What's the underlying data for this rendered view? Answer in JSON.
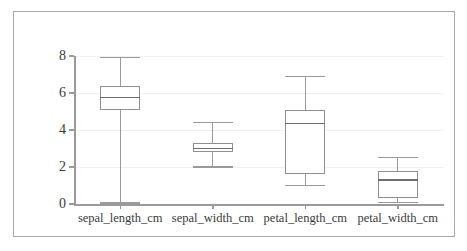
{
  "chart_data": {
    "type": "box",
    "title": "",
    "xlabel": "",
    "ylabel": "",
    "ylim": [
      0,
      8
    ],
    "yticks": [
      0,
      2,
      4,
      6,
      8
    ],
    "ytick_labels": [
      "0",
      "2",
      "4",
      "6",
      "8"
    ],
    "grid": true,
    "legend": "none",
    "categories": [
      "sepal_length_cm",
      "sepal_width_cm",
      "petal_length_cm",
      "petal_width_cm"
    ],
    "boxes": [
      {
        "label": "sepal_length_cm",
        "whisker_low": 0.05,
        "q1": 5.1,
        "median": 5.75,
        "q3": 6.4,
        "whisker_high": 7.9
      },
      {
        "label": "sepal_width_cm",
        "whisker_low": 2.0,
        "q1": 2.8,
        "median": 3.0,
        "q3": 3.3,
        "whisker_high": 4.4
      },
      {
        "label": "petal_length_cm",
        "whisker_low": 1.0,
        "q1": 1.6,
        "median": 4.35,
        "q3": 5.1,
        "whisker_high": 6.9
      },
      {
        "label": "petal_width_cm",
        "whisker_low": 0.1,
        "q1": 0.3,
        "median": 1.3,
        "q3": 1.8,
        "whisker_high": 2.5
      }
    ]
  },
  "style": {
    "frame_border_color": "#a8a8a8",
    "axis_color": "#9a9a9a",
    "grid_color": "#f0f0f0",
    "box_edge_color": "#8f8f8f",
    "box_fill_color": "#ffffff",
    "median_color": "#6e6e6e",
    "text_color": "#3a3a3a",
    "background": "#ffffff"
  }
}
